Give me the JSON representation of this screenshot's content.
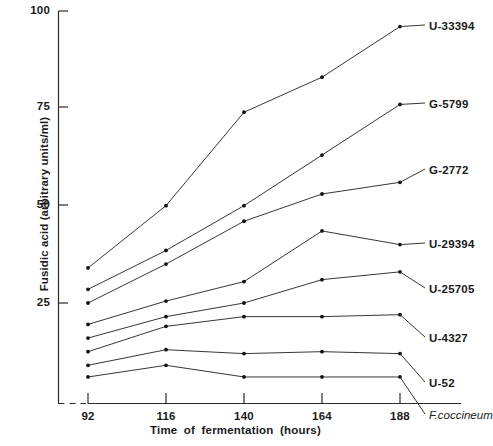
{
  "chart_data": {
    "type": "line",
    "title": "",
    "xlabel": "Time of  fermentation (hours)",
    "ylabel": "Fusidic acid (arbitrary units/ml)",
    "x": [
      92,
      116,
      140,
      164,
      188
    ],
    "xtick_labels": [
      "92",
      "116",
      "140",
      "164",
      "188"
    ],
    "ytick_labels": [
      "25",
      "50",
      "75",
      "100"
    ],
    "yticks": [
      25,
      50,
      75,
      100
    ],
    "ylim": [
      0,
      100
    ],
    "xlim": [
      92,
      188
    ],
    "grid": false,
    "legend": "right-inline-labels",
    "axis_break": true,
    "series": [
      {
        "name": "U-33394",
        "values": [
          34.0,
          50.0,
          74.0,
          83.0,
          96.0
        ]
      },
      {
        "name": "G-5799",
        "values": [
          28.5,
          38.5,
          50.0,
          63.0,
          76.0
        ]
      },
      {
        "name": "G-2772",
        "values": [
          25.0,
          35.0,
          46.0,
          53.0,
          56.0
        ]
      },
      {
        "name": "U-29394",
        "values": [
          19.5,
          25.5,
          30.5,
          43.5,
          40.0
        ]
      },
      {
        "name": "U-25705",
        "values": [
          16.0,
          21.5,
          25.0,
          31.0,
          33.0
        ]
      },
      {
        "name": "U-4327",
        "values": [
          12.5,
          19.0,
          21.5,
          21.5,
          22.0
        ]
      },
      {
        "name": "U-52",
        "values": [
          9.0,
          13.0,
          12.0,
          12.5,
          12.0
        ]
      },
      {
        "name": "F.coccineum",
        "values": [
          6.0,
          9.0,
          6.0,
          6.0,
          6.0
        ]
      }
    ],
    "series_label_style": [
      "normal",
      "normal",
      "normal",
      "normal",
      "normal",
      "normal",
      "normal",
      "italic"
    ]
  },
  "labels": {
    "y_axis_title": "Fusidic acid (arbitrary units/ml)",
    "x_axis_title": "Time of  fermentation (hours)",
    "ytick_0": "25",
    "ytick_1": "50",
    "ytick_2": "75",
    "ytick_3": "100",
    "xtick_0": "92",
    "xtick_1": "116",
    "xtick_2": "140",
    "xtick_3": "164",
    "xtick_4": "188",
    "series_0": "U-33394",
    "series_1": "G-5799",
    "series_2": "G-2772",
    "series_3": "U-29394",
    "series_4": "U-25705",
    "series_5": "U-4327",
    "series_6": "U-52",
    "series_7": "F.coccineum"
  },
  "colors": {
    "ink": "#2b2b2b",
    "background": "#ffffff",
    "point": "#111111"
  }
}
